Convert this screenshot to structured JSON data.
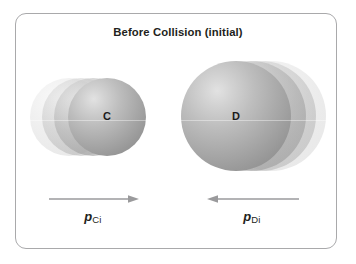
{
  "figure": {
    "title": "Before Collision (initial)",
    "frame_border_color": "#a9a9ab",
    "background_color": "#ffffff"
  },
  "objects": [
    {
      "id": "c",
      "label": "C",
      "role": "smaller sphere moving right",
      "sphere_color": "#ababab",
      "motion_direction": "right",
      "ghost_count": 3
    },
    {
      "id": "d",
      "label": "D",
      "role": "larger sphere moving left",
      "sphere_color": "#ababab",
      "motion_direction": "left",
      "ghost_count": 3
    }
  ],
  "momentum": [
    {
      "id": "pci",
      "symbol": "p",
      "subscript": "Ci",
      "arrow_direction": "right",
      "arrow_color": "#9a9a9c"
    },
    {
      "id": "pdi",
      "symbol": "p",
      "subscript": "Di",
      "arrow_direction": "left",
      "arrow_color": "#9a9a9c"
    }
  ]
}
